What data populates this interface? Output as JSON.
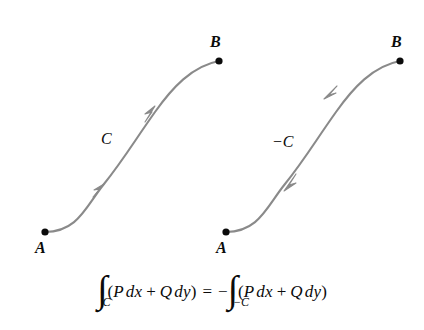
{
  "figure": {
    "background_color": "#ffffff",
    "curve_color": "#8a8a8a",
    "point_color": "#0b0b0b",
    "text_color": "#0b0b0b"
  },
  "panels": [
    {
      "id": "left",
      "curve_label": "C",
      "orientation": "forward",
      "start_label": "A",
      "end_label": "B",
      "start_point": [
        45,
        232
      ],
      "end_point": [
        219,
        61
      ],
      "arrow_count": 2
    },
    {
      "id": "right",
      "curve_label": "−C",
      "orientation": "reverse",
      "start_label": "A",
      "end_label": "B",
      "start_point": [
        226,
        232
      ],
      "end_point": [
        400,
        61
      ],
      "arrow_count": 2
    }
  ],
  "equation": {
    "plain": "∫_C (P dx + Q dy) = −∫_{−C} (P dx + Q dy)",
    "lhs": {
      "integral_glyph": "∫",
      "subscript": "C",
      "open_paren": "(",
      "term1_fn": "P",
      "term1_diff": "dx",
      "plus": "+",
      "term2_fn": "Q",
      "term2_diff": "dy",
      "close_paren": ")"
    },
    "relation": "=",
    "rhs": {
      "sign": "−",
      "integral_glyph": "∫",
      "subscript": "−C",
      "open_paren": "(",
      "term1_fn": "P",
      "term1_diff": "dx",
      "plus": "+",
      "term2_fn": "Q",
      "term2_diff": "dy",
      "close_paren": ")"
    }
  }
}
